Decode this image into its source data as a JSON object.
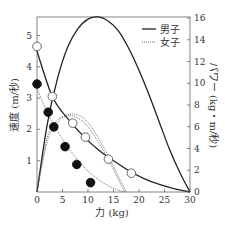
{
  "chart_data": {
    "type": "line",
    "title": "",
    "xlabel": "力 (kg)",
    "ylabel_left": "速度 (m/秒)",
    "ylabel_right": "パワー (kg・m/秒)",
    "xlim": [
      0,
      30
    ],
    "ylim_left": [
      0,
      5.5
    ],
    "ylim_right": [
      0,
      16
    ],
    "x_ticks": [
      0,
      5,
      10,
      15,
      20,
      25,
      30
    ],
    "y_left_ticks": [
      1,
      2,
      3,
      4,
      5
    ],
    "y_right_ticks": [
      0,
      2,
      4,
      6,
      8,
      10,
      12,
      14,
      16
    ],
    "grid": false,
    "legend": {
      "position": "upper right",
      "entries": [
        {
          "label": "男子",
          "style": "solid"
        },
        {
          "label": "女子",
          "style": "dotted"
        }
      ]
    },
    "series": [
      {
        "name": "男子 速度 (測定値)",
        "axis": "left",
        "marker": "open-circle",
        "points": [
          [
            0,
            4.65
          ],
          [
            3,
            3.05
          ],
          [
            7,
            2.2
          ],
          [
            9.5,
            1.75
          ],
          [
            14,
            1.05
          ],
          [
            18.5,
            0.6
          ]
        ]
      },
      {
        "name": "女子 速度 (測定値)",
        "axis": "left",
        "marker": "filled-circle",
        "points": [
          [
            0,
            3.45
          ],
          [
            2.2,
            2.55
          ],
          [
            3.3,
            2.08
          ],
          [
            5.5,
            1.45
          ],
          [
            7.8,
            0.88
          ],
          [
            10.5,
            0.3
          ]
        ]
      },
      {
        "name": "男子 速度曲線",
        "axis": "left",
        "style": "solid",
        "points": [
          [
            0,
            4.5
          ],
          [
            3,
            3.05
          ],
          [
            6,
            2.35
          ],
          [
            9,
            1.8
          ],
          [
            12,
            1.35
          ],
          [
            15,
            1.0
          ],
          [
            18,
            0.68
          ],
          [
            21,
            0.43
          ],
          [
            24,
            0.24
          ],
          [
            27,
            0.1
          ],
          [
            30,
            0
          ]
        ]
      },
      {
        "name": "女子 速度曲線",
        "axis": "left",
        "style": "dotted",
        "points": [
          [
            0,
            3.3
          ],
          [
            2,
            2.55
          ],
          [
            4,
            1.95
          ],
          [
            6,
            1.45
          ],
          [
            8,
            1.02
          ],
          [
            10,
            0.67
          ],
          [
            12,
            0.4
          ],
          [
            14,
            0.2
          ],
          [
            16,
            0.06
          ],
          [
            17.2,
            0
          ]
        ]
      },
      {
        "name": "男子 パワー曲線",
        "axis": "right",
        "style": "solid",
        "points": [
          [
            0,
            0
          ],
          [
            2,
            6.2
          ],
          [
            4,
            10.4
          ],
          [
            6,
            13.3
          ],
          [
            8,
            15.0
          ],
          [
            10,
            15.9
          ],
          [
            12,
            16.1
          ],
          [
            14,
            15.7
          ],
          [
            16,
            14.8
          ],
          [
            18,
            13.2
          ],
          [
            20,
            11.2
          ],
          [
            22,
            8.9
          ],
          [
            24,
            6.4
          ],
          [
            26,
            3.9
          ],
          [
            28,
            1.8
          ],
          [
            30,
            0
          ]
        ]
      },
      {
        "name": "女子 パワー曲線",
        "axis": "right",
        "style": "dotted",
        "points": [
          [
            0,
            0
          ],
          [
            2,
            4.6
          ],
          [
            4,
            6.4
          ],
          [
            6,
            7.0
          ],
          [
            8,
            6.8
          ],
          [
            10,
            6.0
          ],
          [
            12,
            4.6
          ],
          [
            14,
            3.0
          ],
          [
            16,
            1.1
          ],
          [
            17.2,
            0
          ]
        ]
      },
      {
        "name": "女子 パワー曲線 (外側)",
        "axis": "right",
        "style": "dotted",
        "points": [
          [
            0,
            0
          ],
          [
            2,
            5.0
          ],
          [
            4,
            6.6
          ],
          [
            6,
            7.1
          ],
          [
            8,
            7.1
          ],
          [
            10,
            6.4
          ],
          [
            12,
            5.0
          ],
          [
            14,
            3.3
          ],
          [
            16,
            1.4
          ],
          [
            17.5,
            0
          ]
        ]
      }
    ]
  },
  "labels": {
    "x_axis": "力 (kg)",
    "y_left": "速度 (m/秒)",
    "y_right": "パワー (kg・m/秒)",
    "legend_male": "男子",
    "legend_female": "女子"
  },
  "colors": {
    "line": "#222222",
    "axis": "#555555",
    "text": "#333333"
  }
}
